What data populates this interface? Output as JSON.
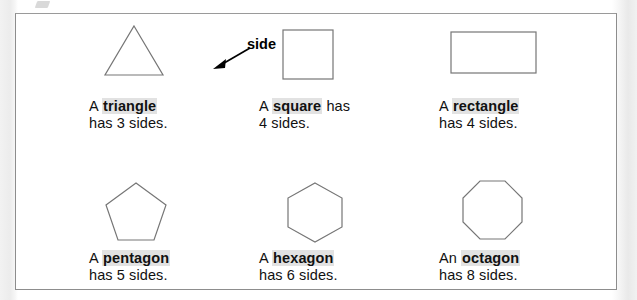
{
  "figure": {
    "callout": {
      "label": "side",
      "icon": "arrow-icon"
    },
    "shapes": [
      {
        "id": "triangle",
        "icon": "triangle-shape",
        "article": "A ",
        "term": "triangle",
        "tail": "",
        "line2": "has 3 sides.",
        "sides": 3
      },
      {
        "id": "square",
        "icon": "square-shape",
        "article": "A ",
        "term": "square",
        "tail": " has",
        "line2": "4 sides.",
        "sides": 4
      },
      {
        "id": "rectangle",
        "icon": "rectangle-shape",
        "article": "A ",
        "term": "rectangle",
        "tail": "",
        "line2": "has 4 sides.",
        "sides": 4
      },
      {
        "id": "pentagon",
        "icon": "pentagon-shape",
        "article": "A ",
        "term": "pentagon",
        "tail": "",
        "line2": "has 5 sides.",
        "sides": 5
      },
      {
        "id": "hexagon",
        "icon": "hexagon-shape",
        "article": "A ",
        "term": "hexagon",
        "tail": "",
        "line2": "has 6 sides.",
        "sides": 6
      },
      {
        "id": "octagon",
        "icon": "octagon-shape",
        "article": "An ",
        "term": "octagon",
        "tail": "",
        "line2": "has 8 sides.",
        "sides": 8
      }
    ],
    "colors": {
      "shape_stroke": "#767676",
      "highlight": "#e2e2e2",
      "text": "#111111",
      "border": "#8d8d8d"
    }
  }
}
